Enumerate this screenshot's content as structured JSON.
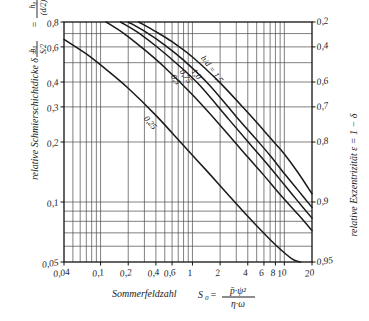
{
  "chart_data": {
    "type": "line",
    "title": "",
    "xlabel": "Sommerfeldzahl  S0 = p̄·ψ² / (η·ω)",
    "ylabel": "relative Schmierschichtdicke δ = h0/(S/2) = h0/((d/2)ψ)",
    "y2label": "relative Exzentrizität ε = 1 − δ",
    "xscale": "log",
    "yscale": "log",
    "xlim": [
      0.04,
      20
    ],
    "ylim": [
      0.05,
      0.8
    ],
    "grid": true,
    "legend": "inline-curve-labels",
    "xticks": [
      "0,04",
      "0,1",
      "0,2",
      "0,4",
      "0,6",
      "1",
      "2",
      "4",
      "6",
      "8",
      "10",
      "20"
    ],
    "xtickvalues": [
      0.04,
      0.1,
      0.2,
      0.4,
      0.6,
      1,
      2,
      4,
      6,
      8,
      10,
      20
    ],
    "yticks": [
      "0,8",
      "0,6",
      "0,4",
      "0,3",
      "0,2",
      "0,1",
      "0,05"
    ],
    "ytickvalues": [
      0.8,
      0.6,
      0.4,
      0.3,
      0.2,
      0.1,
      0.05
    ],
    "y2ticks": [
      "0,2",
      "0,4",
      "0,6",
      "0,7",
      "0,8",
      "0,9",
      "0,95"
    ],
    "y2tickvalues": [
      0.2,
      0.4,
      0.6,
      0.7,
      0.8,
      0.9,
      0.95
    ],
    "series": [
      {
        "name": "b/d = 1,5",
        "label": "b/d = 1,5",
        "points": [
          [
            0.26,
            0.8
          ],
          [
            0.4,
            0.715
          ],
          [
            0.6,
            0.637
          ],
          [
            1.0,
            0.534
          ],
          [
            2.0,
            0.396
          ],
          [
            4.0,
            0.281
          ],
          [
            6.0,
            0.228
          ],
          [
            8.0,
            0.196
          ],
          [
            10.0,
            0.174
          ],
          [
            14.0,
            0.141
          ],
          [
            20.0,
            0.11
          ]
        ]
      },
      {
        "name": "1,0",
        "label": "1,0",
        "points": [
          [
            0.2,
            0.8
          ],
          [
            0.3,
            0.719
          ],
          [
            0.5,
            0.613
          ],
          [
            0.8,
            0.515
          ],
          [
            1.5,
            0.39
          ],
          [
            3.0,
            0.268
          ],
          [
            5.0,
            0.205
          ],
          [
            7.0,
            0.171
          ],
          [
            10.0,
            0.139
          ],
          [
            14.0,
            0.115
          ],
          [
            20.0,
            0.094
          ]
        ]
      },
      {
        "name": "0,75",
        "label": "0,75",
        "points": [
          [
            0.165,
            0.8
          ],
          [
            0.25,
            0.714
          ],
          [
            0.4,
            0.606
          ],
          [
            0.7,
            0.487
          ],
          [
            1.2,
            0.385
          ],
          [
            2.5,
            0.259
          ],
          [
            4.5,
            0.189
          ],
          [
            7.0,
            0.149
          ],
          [
            10.0,
            0.122
          ],
          [
            14.0,
            0.101
          ],
          [
            20.0,
            0.083
          ]
        ]
      },
      {
        "name": "0,5",
        "label": "0,5",
        "points": [
          [
            0.115,
            0.8
          ],
          [
            0.18,
            0.7
          ],
          [
            0.3,
            0.581
          ],
          [
            0.5,
            0.473
          ],
          [
            1.0,
            0.345
          ],
          [
            2.0,
            0.243
          ],
          [
            4.0,
            0.168
          ],
          [
            6.0,
            0.136
          ],
          [
            9.0,
            0.109
          ],
          [
            14.0,
            0.087
          ],
          [
            20.0,
            0.072
          ]
        ]
      },
      {
        "name": "0,25",
        "label": "0,25",
        "points": [
          [
            0.04,
            0.655
          ],
          [
            0.07,
            0.553
          ],
          [
            0.12,
            0.455
          ],
          [
            0.2,
            0.372
          ],
          [
            0.4,
            0.272
          ],
          [
            0.8,
            0.192
          ],
          [
            1.5,
            0.14
          ],
          [
            3.0,
            0.098
          ],
          [
            5.0,
            0.076
          ],
          [
            8.0,
            0.061
          ],
          [
            12.0,
            0.052
          ],
          [
            15.0,
            0.05
          ]
        ]
      }
    ]
  },
  "figure": {
    "frame": {
      "left": 64,
      "top": 22,
      "right": 312,
      "bottom": 262
    }
  }
}
